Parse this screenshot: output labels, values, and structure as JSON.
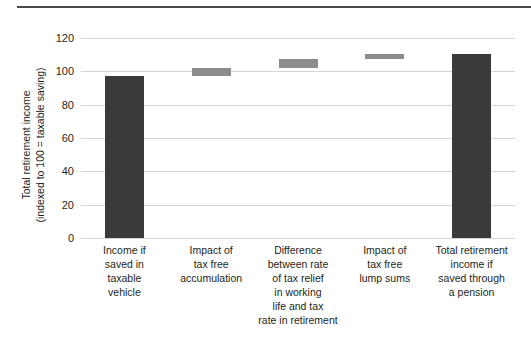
{
  "chart_data": {
    "type": "bar",
    "chart_subtype": "waterfall",
    "title": "",
    "xlabel": "",
    "ylabel": "Total retirement income (indexed to 100 = taxable saving)",
    "ylabel_lines": [
      "Total retirement income",
      "(indexed to 100 = taxable saving)"
    ],
    "ylim": [
      0,
      120
    ],
    "yticks": [
      0,
      20,
      40,
      60,
      80,
      100,
      120
    ],
    "ytick_labels": [
      "0",
      "20",
      "40",
      "60",
      "80",
      "100",
      "120"
    ],
    "grid": true,
    "legend": "none",
    "categories": [
      "Income if saved in taxable vehicle",
      "Impact of tax free accumulation",
      "Difference between rate of tax relief in working life and tax rate in retirement",
      "Impact of tax free lump sums",
      "Total retirement income if saved through a pension"
    ],
    "category_label_lines": [
      [
        "Income if",
        "saved in",
        "taxable",
        "vehicle"
      ],
      [
        "Impact of",
        "tax free",
        "accumulation"
      ],
      [
        "Difference",
        "between rate",
        "of tax relief",
        "in working",
        "life and tax",
        "rate in retirement"
      ],
      [
        "Impact of",
        "tax free",
        "lump sums"
      ],
      [
        "Total retirement",
        "income if",
        "saved through",
        "a pension"
      ]
    ],
    "bars": [
      {
        "label": "Income if saved in taxable vehicle",
        "kind": "total",
        "base": 0,
        "top": 97,
        "value": 97,
        "color": "#3a3a3a"
      },
      {
        "label": "Impact of tax free accumulation",
        "kind": "delta",
        "base": 97,
        "top": 102,
        "value": 5,
        "color": "#8c8c8c"
      },
      {
        "label": "Difference between rate of tax relief in working life and tax rate in retirement",
        "kind": "delta",
        "base": 102,
        "top": 107.5,
        "value": 5.5,
        "color": "#8c8c8c"
      },
      {
        "label": "Impact of tax free lump sums",
        "kind": "delta",
        "base": 107.5,
        "top": 110.5,
        "value": 3,
        "color": "#8c8c8c"
      },
      {
        "label": "Total retirement income if saved through a pension",
        "kind": "total",
        "base": 0,
        "top": 110.5,
        "value": 110.5,
        "color": "#3a3a3a"
      }
    ],
    "values": [
      97,
      5,
      5.5,
      3,
      110.5
    ],
    "colors": {
      "total_bar": "#3a3a3a",
      "delta_bar": "#8c8c8c",
      "gridline": "#d4d4d4",
      "text": "#231f20",
      "rule": "#4a4a4a",
      "background": "#ffffff"
    }
  }
}
